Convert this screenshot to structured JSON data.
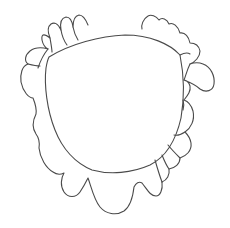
{
  "drawing": {
    "description": "Line drawing of a rounded shield-like head outline surrounded by a wavy scalloped mane/frill",
    "background": "#ffffff",
    "stroke_color": "#4a4a4a",
    "stroke_width": 1.1,
    "parts": [
      "inner-head-outline",
      "outer-scalloped-mane",
      "mane-inner-strokes"
    ]
  }
}
